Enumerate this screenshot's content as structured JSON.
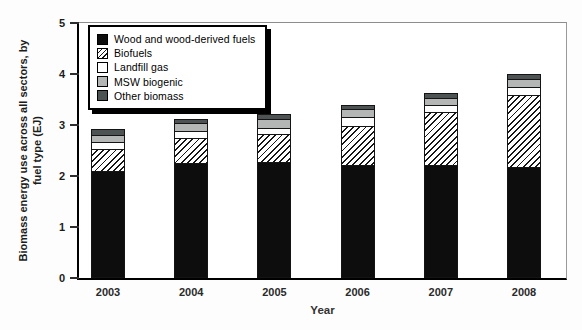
{
  "chart_data": {
    "type": "bar",
    "subtype": "stacked",
    "title": "",
    "xlabel": "Year",
    "ylabel": "Biomass energy use across all sectors, by fuel type (EJ)",
    "ylabel_lines": [
      "Biomass energy use across all sectors, by",
      "fuel type (EJ)"
    ],
    "ylim": [
      0,
      5
    ],
    "yticks": [
      0,
      1,
      2,
      3,
      4,
      5
    ],
    "grid": false,
    "legend_position": "upper-left",
    "categories": [
      "2003",
      "2004",
      "2005",
      "2006",
      "2007",
      "2008"
    ],
    "series": [
      {
        "name": "Wood and wood-derived fuels",
        "key": "wood",
        "fill": "#0d0d0d",
        "pattern": "solid",
        "values": [
          2.1,
          2.25,
          2.27,
          2.21,
          2.21,
          2.17
        ]
      },
      {
        "name": "Biofuels",
        "key": "biofuels",
        "fill": "#ffffff",
        "pattern": "diagonal-hatch",
        "values": [
          0.44,
          0.52,
          0.58,
          0.8,
          1.06,
          1.43
        ]
      },
      {
        "name": "Landfill gas",
        "key": "landfill",
        "fill": "#ffffff",
        "pattern": "solid",
        "values": [
          0.16,
          0.15,
          0.13,
          0.19,
          0.17,
          0.18
        ]
      },
      {
        "name": "MSW biogenic",
        "key": "msw",
        "fill": "#b3b6b5",
        "pattern": "solid",
        "values": [
          0.17,
          0.18,
          0.2,
          0.18,
          0.14,
          0.18
        ]
      },
      {
        "name": "Other biomass",
        "key": "other",
        "fill": "#4d5252",
        "pattern": "solid",
        "values": [
          0.13,
          0.1,
          0.11,
          0.1,
          0.12,
          0.11
        ]
      }
    ]
  }
}
